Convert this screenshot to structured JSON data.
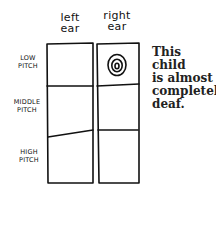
{
  "columns": [
    {
      "label_line1": "left",
      "label_line2": "ear"
    },
    {
      "label_line1": "right",
      "label_line2": "ear"
    }
  ],
  "rows": [
    {
      "line1": "LOW",
      "line2": "PITCH"
    },
    {
      "line1": "MIDDLE",
      "line2": "PITCH"
    },
    {
      "line1": "HIGH",
      "line2": "PITCH"
    }
  ],
  "marker": {
    "icon": "concentric-circles-icon",
    "column": "right ear",
    "row": "LOW PITCH"
  },
  "caption": {
    "line1": "This child",
    "line2": "is almost",
    "line3": "completely",
    "line4": "deaf."
  }
}
